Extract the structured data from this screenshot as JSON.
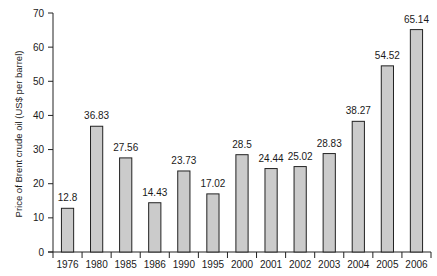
{
  "chart_data": {
    "type": "bar",
    "title": "",
    "xlabel": "",
    "ylabel": "Price of Brent crude oil (US$ per barrel)",
    "ylim": [
      0,
      70
    ],
    "yticks": [
      0,
      10,
      20,
      30,
      40,
      50,
      60,
      70
    ],
    "grid": false,
    "legend": "none",
    "categories": [
      "1976",
      "1980",
      "1985",
      "1986",
      "1990",
      "1995",
      "2000",
      "2001",
      "2002",
      "2003",
      "2004",
      "2005",
      "2006"
    ],
    "values": [
      12.8,
      36.83,
      27.56,
      14.43,
      23.73,
      17.02,
      28.5,
      24.44,
      25.02,
      28.83,
      38.27,
      54.52,
      65.14
    ],
    "data_labels": [
      "12.8",
      "36.83",
      "27.56",
      "14.43",
      "23.73",
      "17.02",
      "28.5",
      "24.44",
      "25.02",
      "28.83",
      "38.27",
      "54.52",
      "65.14"
    ],
    "colors": {
      "bar_fill": "#cbcbcb",
      "bar_stroke": "#222222"
    }
  }
}
